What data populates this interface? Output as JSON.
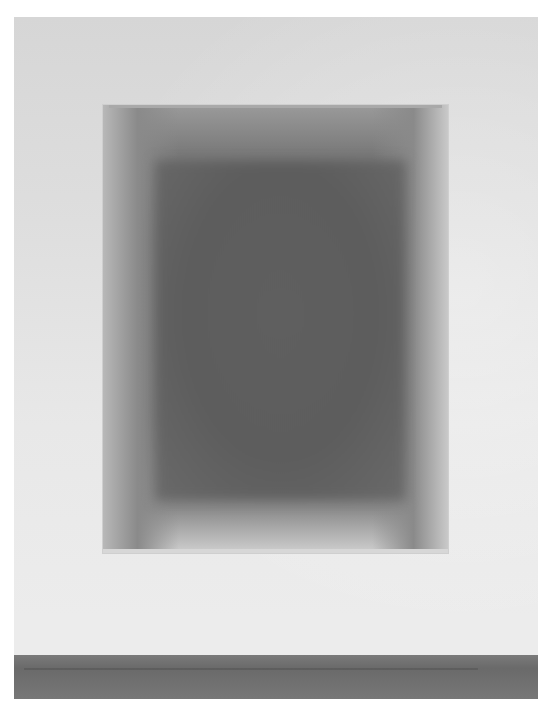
{
  "image": {
    "description": "Photograph of a framed gradient artwork hanging on a white wall above a grey floor",
    "colors": {
      "wall": "#e2e2e2",
      "frame_edge": "#bdbdbd",
      "inner_dark": "#5e5e5e",
      "floor": "#707070"
    }
  }
}
